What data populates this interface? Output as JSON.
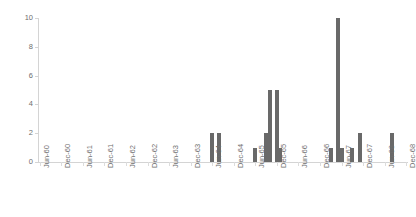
{
  "chart_data": {
    "type": "bar",
    "title": "",
    "subtitle": "",
    "xlabel": "",
    "ylabel": "",
    "ylim": [
      0,
      10
    ],
    "yticks": [
      0,
      2,
      4,
      6,
      8,
      10
    ],
    "grid": false,
    "legend": null,
    "bar_color": "#696969",
    "axis_color": "#d4d4d4",
    "tick_label_color": "#6e6e6e",
    "xtick_labels": [
      "Jun-60",
      "Dec-60",
      "Jun-61",
      "Dec-61",
      "Jun-62",
      "Dec-62",
      "Jun-63",
      "Dec-63",
      "Jun-64",
      "Dec-64",
      "Jun-65",
      "Dec-65",
      "Jun-66",
      "Dec-66",
      "Jun-67",
      "Dec-67",
      "Jun-68",
      "Dec-68"
    ],
    "categories": [
      "Jun-60",
      "Jul-60",
      "Aug-60",
      "Sep-60",
      "Oct-60",
      "Nov-60",
      "Dec-60",
      "Jan-61",
      "Feb-61",
      "Mar-61",
      "Apr-61",
      "May-61",
      "Jun-61",
      "Jul-61",
      "Aug-61",
      "Sep-61",
      "Oct-61",
      "Nov-61",
      "Dec-61",
      "Jan-62",
      "Feb-62",
      "Mar-62",
      "Apr-62",
      "May-62",
      "Jun-62",
      "Jul-62",
      "Aug-62",
      "Sep-62",
      "Oct-62",
      "Nov-62",
      "Dec-62",
      "Jan-63",
      "Feb-63",
      "Mar-63",
      "Apr-63",
      "May-63",
      "Jun-63",
      "Jul-63",
      "Aug-63",
      "Sep-63",
      "Oct-63",
      "Nov-63",
      "Dec-63",
      "Jan-64",
      "Feb-64",
      "Mar-64",
      "Apr-64",
      "May-64",
      "Jun-64",
      "Jul-64",
      "Aug-64",
      "Sep-64",
      "Oct-64",
      "Nov-64",
      "Dec-64",
      "Jan-65",
      "Feb-65",
      "Mar-65",
      "Apr-65",
      "May-65",
      "Jun-65",
      "Jul-65",
      "Aug-65",
      "Sep-65",
      "Oct-65",
      "Nov-65",
      "Dec-65",
      "Jan-66",
      "Feb-66",
      "Mar-66",
      "Apr-66",
      "May-66",
      "Jun-66",
      "Jul-66",
      "Aug-66",
      "Sep-66",
      "Oct-66",
      "Nov-66",
      "Dec-66",
      "Jan-67",
      "Feb-67",
      "Mar-67",
      "Apr-67",
      "May-67",
      "Jun-67",
      "Jul-67",
      "Aug-67",
      "Sep-67",
      "Oct-67",
      "Nov-67",
      "Dec-67",
      "Jan-68",
      "Feb-68",
      "Mar-68",
      "Apr-68",
      "May-68",
      "Jun-68",
      "Jul-68",
      "Aug-68",
      "Sep-68",
      "Oct-68",
      "Nov-68",
      "Dec-68"
    ],
    "values": [
      0,
      0,
      0,
      0,
      0,
      0,
      0,
      0,
      0,
      0,
      0,
      0,
      0,
      0,
      0,
      0,
      0,
      0,
      0,
      0,
      0,
      0,
      0,
      0,
      0,
      0,
      0,
      0,
      0,
      0,
      0,
      0,
      0,
      0,
      0,
      0,
      0,
      0,
      0,
      0,
      0,
      0,
      0,
      0,
      0,
      0,
      0,
      0,
      2,
      0,
      2,
      0,
      0,
      0,
      0,
      0,
      0,
      0,
      0,
      0,
      1,
      0,
      0,
      2,
      5,
      0,
      5,
      1,
      0,
      0,
      0,
      0,
      0,
      0,
      0,
      0,
      0,
      0,
      0,
      0,
      0,
      1,
      0,
      10,
      1,
      0,
      0,
      1,
      0,
      2,
      0,
      0,
      0,
      0,
      0,
      0,
      0,
      0,
      2,
      0,
      0,
      0,
      0
    ]
  }
}
